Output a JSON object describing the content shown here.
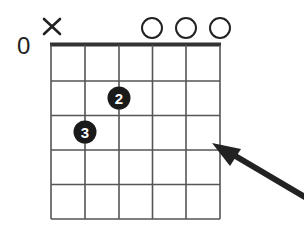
{
  "diagram": {
    "type": "guitar-chord-diagram",
    "start_fret_label": "0",
    "num_strings": 6,
    "num_frets": 5,
    "string_markers": [
      {
        "string": 6,
        "marker": "×",
        "meaning": "muted"
      },
      {
        "string": 3,
        "marker": "○",
        "meaning": "open"
      },
      {
        "string": 2,
        "marker": "○",
        "meaning": "open"
      },
      {
        "string": 1,
        "marker": "○",
        "meaning": "open"
      }
    ],
    "fingers": [
      {
        "string": 4,
        "fret": 2,
        "finger": "2"
      },
      {
        "string": 5,
        "fret": 3,
        "finger": "3"
      }
    ],
    "annotation": {
      "type": "arrow",
      "points_to": "string 1, fret 3 area"
    },
    "colors": {
      "line": "#555555",
      "nut": "#333333",
      "dot": "#1a1a1a",
      "arrow": "#222222"
    }
  }
}
